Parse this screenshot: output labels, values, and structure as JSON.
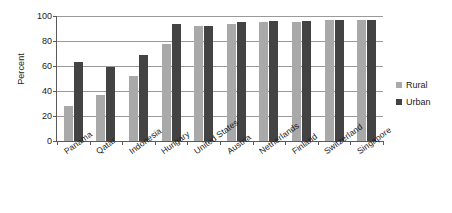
{
  "chart_data": {
    "type": "bar",
    "title": "",
    "xlabel": "",
    "ylabel": "Percent",
    "ylim": [
      0,
      100
    ],
    "yticks": [
      0,
      20,
      40,
      60,
      80,
      100
    ],
    "grid": true,
    "legend_position": "right",
    "categories": [
      "Panama",
      "Qatar",
      "Indonesia",
      "Hungary",
      "United States",
      "Austria",
      "Netherlands",
      "Finland",
      "Switzerland",
      "Singapore"
    ],
    "series": [
      {
        "name": "Rural",
        "color": "#a9a9a9",
        "values": [
          28,
          37,
          52,
          78,
          92,
          94,
          95,
          95,
          97,
          97
        ]
      },
      {
        "name": "Urban",
        "color": "#434343",
        "values": [
          63,
          59,
          69,
          94,
          92,
          95,
          96,
          96,
          97,
          97
        ]
      }
    ]
  },
  "legend": {
    "items": [
      {
        "label": "Rural"
      },
      {
        "label": "Urban"
      }
    ]
  }
}
